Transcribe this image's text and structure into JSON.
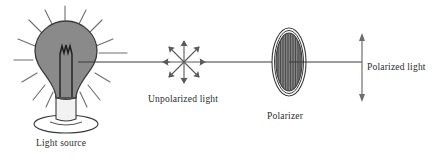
{
  "diagram": {
    "background_color": "#ffffff",
    "stroke_color": "#3a3a3a",
    "bulb_fill_color": "#8a8a8a",
    "polarizer_stripe_color": "#8a8a8a",
    "polarizer_dark_stripe_color": "#4a4a4a",
    "socket_fill_color": "#f2f2f2",
    "labels": {
      "light_source": "Light source",
      "unpolarized_light": "Unpolarized light",
      "polarizer": "Polarizer",
      "polarized_light": "Polarized light"
    },
    "elements": {
      "light_source": {
        "name": "light-bulb",
        "rays_count": 12,
        "has_filament": true,
        "has_socket": true,
        "has_stand": true
      },
      "unpolarized_light": {
        "name": "starburst-arrows",
        "arrow_count": 8,
        "arrow_angles_deg": [
          0,
          45,
          90,
          135,
          180,
          225,
          270,
          315
        ],
        "meaning": "light vibrating in all planes"
      },
      "polarizer": {
        "name": "polarizing-filter",
        "shape": "ellipse",
        "rings": 2,
        "stripe_count": 11,
        "stripe_orientation": "vertical",
        "meaning": "transmission axis vertical"
      },
      "polarized_light": {
        "name": "vertical-double-arrow",
        "orientation": "vertical",
        "arrowheads": 2,
        "meaning": "light vibrating in one plane"
      },
      "beam": {
        "name": "light-beam",
        "segments": 3,
        "orientation": "horizontal"
      }
    }
  }
}
